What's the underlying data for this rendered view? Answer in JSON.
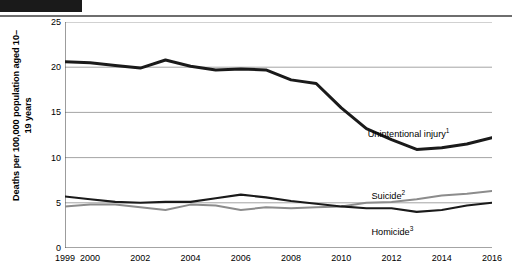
{
  "header": {
    "redaction_bar": "",
    "rule": ""
  },
  "chart_data": {
    "type": "line",
    "title": "",
    "xlabel": "",
    "ylabel": "Deaths per 100,000 population aged 10–19 years",
    "ylim": [
      0,
      25
    ],
    "yticks": [
      0,
      5,
      10,
      15,
      20,
      25
    ],
    "xlim": [
      1999,
      2016
    ],
    "xticks": [
      1999,
      2000,
      2002,
      2004,
      2006,
      2008,
      2010,
      2012,
      2014,
      2016
    ],
    "xtick_labels": [
      "1999",
      "2000",
      "2002",
      "2004",
      "2006",
      "2008",
      "2010",
      "2012",
      "2014",
      "2016"
    ],
    "grid": "horizontal",
    "legend_position": "inline-annotations",
    "x": [
      1999,
      2000,
      2001,
      2002,
      2003,
      2004,
      2005,
      2006,
      2007,
      2008,
      2009,
      2010,
      2011,
      2012,
      2013,
      2014,
      2015,
      2016
    ],
    "series": [
      {
        "name": "Unintentional injury",
        "footnote": "1",
        "label": "Unintentional injury",
        "color": "#1a1a1a",
        "width": 3.0,
        "values": [
          20.6,
          20.5,
          20.2,
          19.9,
          20.8,
          20.1,
          19.7,
          19.8,
          19.7,
          18.6,
          18.2,
          15.5,
          13.2,
          12.0,
          10.9,
          11.1,
          11.5,
          12.2
        ]
      },
      {
        "name": "Suicide",
        "footnote": "2",
        "label": "Suicide",
        "color": "#8c8c8c",
        "width": 2.0,
        "values": [
          4.6,
          4.8,
          4.8,
          4.5,
          4.2,
          4.8,
          4.7,
          4.2,
          4.5,
          4.4,
          4.5,
          4.6,
          5.0,
          5.1,
          5.4,
          5.8,
          6.0,
          6.3
        ]
      },
      {
        "name": "Homicide",
        "footnote": "3",
        "label": "Homicide",
        "color": "#1a1a1a",
        "width": 2.1,
        "values": [
          5.7,
          5.4,
          5.1,
          5.0,
          5.1,
          5.1,
          5.5,
          5.9,
          5.6,
          5.2,
          4.9,
          4.6,
          4.4,
          4.4,
          4.0,
          4.2,
          4.7,
          5.0
        ]
      }
    ],
    "annotations": [
      {
        "text": "Unintentional injury",
        "sup": "1",
        "x": 2011.05,
        "y": 13.35
      },
      {
        "text": "Suicide",
        "sup": "2",
        "x": 2011.2,
        "y": 6.55
      },
      {
        "text": "Homicide",
        "sup": "3",
        "x": 2011.2,
        "y": 2.55
      }
    ]
  }
}
